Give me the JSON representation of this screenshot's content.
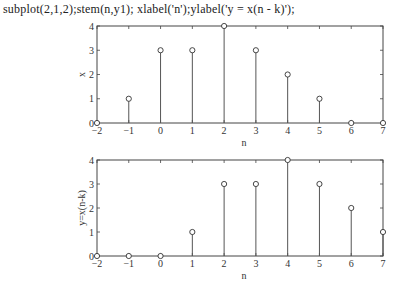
{
  "code_line": "subplot(2,1,2);stem(n,y1); xlabel('n');ylabel('y = x(n - k)');",
  "chart_data": [
    {
      "type": "stem",
      "title": "",
      "xlabel": "n",
      "ylabel": "x",
      "x": [
        -2,
        -1,
        0,
        1,
        2,
        3,
        4,
        5,
        6,
        7
      ],
      "values": [
        0,
        1,
        3,
        3,
        4,
        3,
        2,
        1,
        0,
        0
      ],
      "xlim": [
        -2,
        7
      ],
      "ylim": [
        0,
        4
      ],
      "xticks": [
        -2,
        -1,
        0,
        1,
        2,
        3,
        4,
        5,
        6,
        7
      ],
      "yticks": [
        0,
        1,
        2,
        3,
        4
      ],
      "grid": false
    },
    {
      "type": "stem",
      "title": "",
      "xlabel": "n",
      "ylabel": "y=x(n-k)",
      "x": [
        -2,
        -1,
        0,
        1,
        2,
        3,
        4,
        5,
        6,
        7
      ],
      "values": [
        0,
        0,
        0,
        1,
        3,
        3,
        4,
        3,
        2,
        1
      ],
      "xlim": [
        -2,
        7
      ],
      "ylim": [
        0,
        4
      ],
      "xticks": [
        -2,
        -1,
        0,
        1,
        2,
        3,
        4,
        5,
        6,
        7
      ],
      "yticks": [
        0,
        1,
        2,
        3,
        4
      ],
      "grid": false
    }
  ]
}
